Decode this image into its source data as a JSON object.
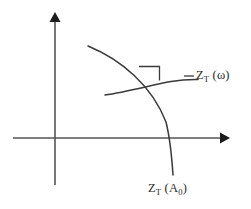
{
  "figure": {
    "background_color": "#ffffff",
    "width": 251,
    "height": 209,
    "axes": {
      "name": "cartesian-axes",
      "stroke_color": "#555555",
      "x_axis": {
        "y": 138,
        "x_start": 13,
        "x_end": 227,
        "arrow": "right"
      },
      "y_axis": {
        "x": 55,
        "y_start": 185,
        "y_end": 15,
        "arrow": "up"
      },
      "origin": {
        "x": 55,
        "y": 138
      }
    },
    "curves": [
      {
        "id": "zt-a0-arc",
        "label_text": "Z",
        "label_sub": "T",
        "label_arg_open": " (A",
        "label_arg_sub": "0",
        "label_arg_close": ")",
        "label_full": "Z_T (A_0)",
        "stroke_color": "#3a3a3a",
        "description": "constant-amplitude arc",
        "start": {
          "x": 88,
          "y": 46
        },
        "end": {
          "x": 173,
          "y": 175
        }
      },
      {
        "id": "zt-omega-curve",
        "label_text": "Z",
        "label_sub": "T",
        "label_arg_open": " (ω",
        "label_arg_close": ")",
        "label_full": "Z_T (ω)",
        "stroke_color": "#3a3a3a",
        "description": "constant-frequency curve",
        "start": {
          "x": 105,
          "y": 95
        },
        "end": {
          "x": 198,
          "y": 80
        }
      }
    ],
    "annotations": {
      "right_angle": {
        "name": "right-angle-marker",
        "description": "square marking orthogonal intersection of the two curves",
        "x": 139,
        "y": 66,
        "size": 14
      },
      "leader_line": {
        "name": "omega-label-leader",
        "x_start": 184,
        "x_end": 194,
        "y": 76
      }
    },
    "labels": {
      "omega": {
        "name": "curve-label-zt-omega",
        "z": "Z",
        "sub_t": "T",
        "arg": " (ω)",
        "x": 196,
        "y": 69
      },
      "a0": {
        "name": "curve-label-zt-a0",
        "z": "Z",
        "sub_t": "T",
        "arg_open": " (A",
        "arg_sub": "0",
        "arg_close": ")",
        "x": 148,
        "y": 182
      }
    }
  }
}
